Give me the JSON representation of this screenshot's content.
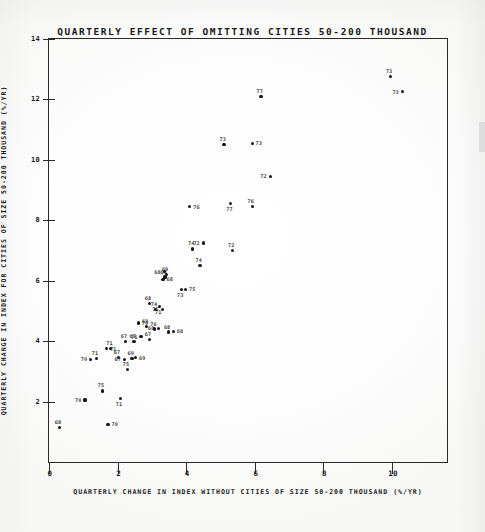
{
  "chart_data": {
    "type": "scatter",
    "title": "QUARTERLY EFFECT OF OMITTING CITIES 50-200 THOUSAND",
    "xlabel": "QUARTERLY CHANGE IN INDEX WITHOUT CITIES OF SIZE 50-200 THOUSAND (%/YR)",
    "ylabel": "QUARTERLY CHANGE IN INDEX FOR CITIES OF SIZE 50-200 THOUSAND (%/YR)",
    "xlim": [
      0,
      11.6
    ],
    "ylim": [
      0,
      14
    ],
    "xticks": [
      0,
      2,
      4,
      6,
      8,
      10
    ],
    "yticks": [
      2,
      4,
      6,
      8,
      10,
      12,
      14
    ],
    "grid": false,
    "legend": null,
    "point_label_field": "year",
    "points": [
      {
        "x": 0.3,
        "y": 1.15,
        "label": "68"
      },
      {
        "x": 1.05,
        "y": 2.05,
        "label": "70"
      },
      {
        "x": 1.55,
        "y": 2.35,
        "label": "75"
      },
      {
        "x": 1.72,
        "y": 1.25,
        "label": "70"
      },
      {
        "x": 2.08,
        "y": 2.1,
        "label": "71"
      },
      {
        "x": 2.28,
        "y": 3.05,
        "label": "75"
      },
      {
        "x": 1.22,
        "y": 3.4,
        "label": "70"
      },
      {
        "x": 1.38,
        "y": 3.42,
        "label": "71"
      },
      {
        "x": 1.68,
        "y": 3.75,
        "label": "71"
      },
      {
        "x": 1.8,
        "y": 3.75,
        "label": "71"
      },
      {
        "x": 2.02,
        "y": 3.45,
        "label": "67"
      },
      {
        "x": 2.2,
        "y": 3.4,
        "label": "67"
      },
      {
        "x": 2.42,
        "y": 3.42,
        "label": "69"
      },
      {
        "x": 2.52,
        "y": 3.45,
        "label": "69"
      },
      {
        "x": 2.22,
        "y": 4.0,
        "label": "67"
      },
      {
        "x": 2.48,
        "y": 3.98,
        "label": "67"
      },
      {
        "x": 2.68,
        "y": 4.15,
        "label": "76"
      },
      {
        "x": 2.92,
        "y": 4.05,
        "label": "67"
      },
      {
        "x": 2.6,
        "y": 4.6,
        "label": "70"
      },
      {
        "x": 2.84,
        "y": 4.48,
        "label": "69"
      },
      {
        "x": 3.08,
        "y": 4.4,
        "label": "76"
      },
      {
        "x": 3.18,
        "y": 4.42,
        "label": "68"
      },
      {
        "x": 3.48,
        "y": 4.3,
        "label": "68"
      },
      {
        "x": 3.62,
        "y": 4.32,
        "label": "68"
      },
      {
        "x": 3.1,
        "y": 5.05,
        "label": "74"
      },
      {
        "x": 3.22,
        "y": 5.15,
        "label": "71"
      },
      {
        "x": 3.3,
        "y": 5.05,
        "label": "75"
      },
      {
        "x": 2.92,
        "y": 5.25,
        "label": "68"
      },
      {
        "x": 3.32,
        "y": 6.05,
        "label": "68"
      },
      {
        "x": 3.38,
        "y": 6.12,
        "label": "68"
      },
      {
        "x": 3.42,
        "y": 6.2,
        "label": "69"
      },
      {
        "x": 3.36,
        "y": 6.3,
        "label": "68"
      },
      {
        "x": 3.86,
        "y": 5.7,
        "label": "73"
      },
      {
        "x": 3.98,
        "y": 5.72,
        "label": "75"
      },
      {
        "x": 4.4,
        "y": 6.5,
        "label": "74"
      },
      {
        "x": 4.18,
        "y": 7.05,
        "label": "74"
      },
      {
        "x": 4.5,
        "y": 7.25,
        "label": "72"
      },
      {
        "x": 5.35,
        "y": 7.0,
        "label": "72"
      },
      {
        "x": 4.1,
        "y": 8.45,
        "label": "76"
      },
      {
        "x": 5.3,
        "y": 8.55,
        "label": "77"
      },
      {
        "x": 5.92,
        "y": 8.45,
        "label": "76"
      },
      {
        "x": 6.45,
        "y": 9.45,
        "label": "72"
      },
      {
        "x": 5.1,
        "y": 10.5,
        "label": "73"
      },
      {
        "x": 5.92,
        "y": 10.55,
        "label": "73"
      },
      {
        "x": 6.18,
        "y": 12.1,
        "label": "77"
      },
      {
        "x": 9.95,
        "y": 12.75,
        "label": "73"
      },
      {
        "x": 10.3,
        "y": 12.25,
        "label": "73"
      }
    ]
  }
}
